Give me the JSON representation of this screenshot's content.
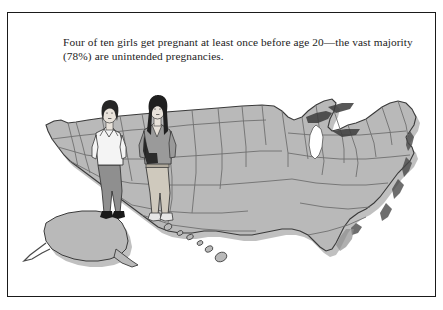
{
  "figure": {
    "caption": "Four of ten girls get pregnant at least once before age 20—the vast majority (78%) are unintended pregnancies.",
    "border_color": "#1a1a1a",
    "background_color": "#ffffff"
  },
  "illustration": {
    "type": "united-states-map-with-two-standing-female-figures",
    "map": {
      "name": "united-states-map",
      "description": "Gray shaded map of the United States with state boundaries, including Alaska and Hawaii inset at lower left, drawn with a drop shadow.",
      "fill_color": "#b9b9b9",
      "state_border_color": "#6a6a6a",
      "outline_color": "#3a3a3a",
      "shadow_color": "#8a8a8a",
      "lake_color": "#ffffff",
      "lake_label": "Lake Michigan",
      "insets": [
        "Alaska",
        "Hawaii"
      ]
    },
    "figures": [
      {
        "name": "girl-figure-left",
        "description": "Young woman with short dark bob hairstyle, light collared blouse, gray trousers and black heeled shoes, standing with hands at hips.",
        "hair_color": "#262626",
        "top_color": "#f4f4f4",
        "pants_color": "#8f8f8f",
        "shoe_color": "#1a1a1a",
        "skin_color": "#e8e2da"
      },
      {
        "name": "girl-figure-right",
        "description": "Young woman with long straight dark hair, gray V-neck top, light tan pants, a dark shoulder bag and light sneakers.",
        "hair_color": "#1f1f1f",
        "top_color": "#9a9a9a",
        "pants_color": "#cfc9bd",
        "shoe_color": "#e6e6e6",
        "bag_color": "#1f1f1f",
        "skin_color": "#e8e2da"
      }
    ]
  }
}
